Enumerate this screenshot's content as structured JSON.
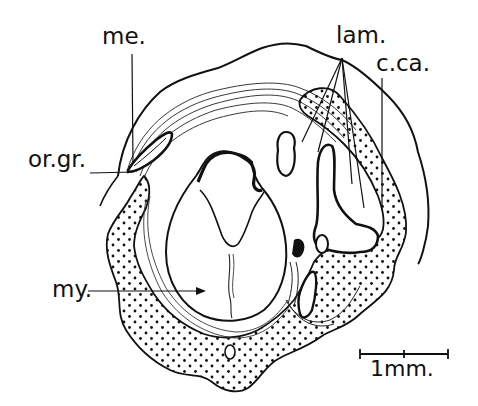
{
  "figure": {
    "type": "anatomical cross-section illustration",
    "labels": {
      "me": "me.",
      "lam": "lam.",
      "cca": "c.ca.",
      "orgr": "or.gr.",
      "my": "my."
    },
    "scale_bar": {
      "label": "1mm."
    },
    "colors": {
      "ink": "#111111",
      "background": "#ffffff"
    }
  }
}
